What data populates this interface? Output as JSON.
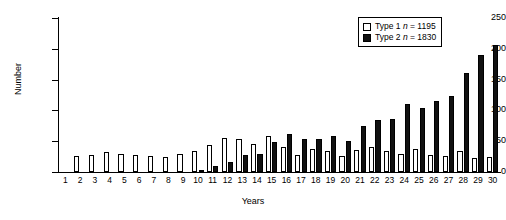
{
  "chart_data": {
    "type": "bar",
    "title": "",
    "xlabel": "Years",
    "ylabel": "Number",
    "ylim": [
      0,
      250
    ],
    "yticks": [
      0,
      50,
      100,
      150,
      200,
      250
    ],
    "grid": false,
    "legend_position": "top-right",
    "categories": [
      "1",
      "2",
      "3",
      "4",
      "5",
      "6",
      "7",
      "8",
      "9",
      "10",
      "11",
      "12",
      "13",
      "14",
      "15",
      "16",
      "17",
      "18",
      "19",
      "20",
      "21",
      "22",
      "23",
      "24",
      "25",
      "26",
      "27",
      "28",
      "29",
      "30"
    ],
    "series": [
      {
        "name": "Type 1",
        "n": 1195,
        "legend_label": "Type 1",
        "legend_n_prefix": "n",
        "legend_n_value": "= 1195",
        "color": "#ffffff",
        "edge_color": "#000000",
        "swatch": "open-square",
        "values": [
          0,
          26,
          28,
          32,
          30,
          28,
          26,
          24,
          30,
          34,
          44,
          56,
          54,
          46,
          58,
          40,
          28,
          38,
          34,
          26,
          36,
          40,
          34,
          30,
          38,
          28,
          26,
          34,
          22,
          24
        ]
      },
      {
        "name": "Type 2",
        "n": 1830,
        "legend_label": "Type 2",
        "legend_n_prefix": "n",
        "legend_n_value": "= 1830",
        "color": "#111111",
        "edge_color": "#000000",
        "swatch": "filled-square",
        "values": [
          0,
          0,
          0,
          0,
          0,
          0,
          0,
          0,
          0,
          3,
          10,
          16,
          28,
          30,
          48,
          62,
          54,
          54,
          58,
          50,
          74,
          84,
          86,
          110,
          104,
          116,
          124,
          160,
          190,
          207
        ]
      }
    ]
  },
  "axis": {
    "y_title": "Number",
    "x_title": "Years"
  }
}
